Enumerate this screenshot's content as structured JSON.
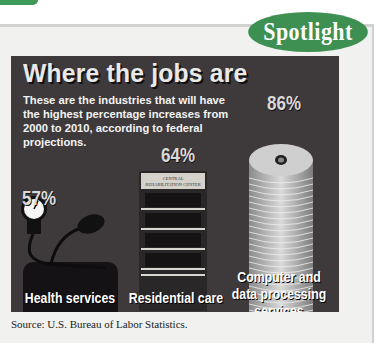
{
  "header": {
    "badge_label": "Spotlight"
  },
  "colors": {
    "accent": "#3d8f52",
    "panel_background": "#3e3a3c",
    "text_light": "#f3f3f3"
  },
  "chart_data": {
    "type": "bar",
    "title": "Where the jobs are",
    "subtitle": "These are the industries that will have the highest percentage increases from 2000 to 2010, according to federal projections.",
    "categories": [
      "Health services",
      "Residential care",
      "Computer and data processing services"
    ],
    "values": [
      57,
      64,
      86
    ],
    "value_labels": [
      "57%",
      "64%",
      "86%"
    ],
    "unit": "%",
    "icons": [
      "blood-pressure-gauge",
      "building",
      "cd-stack"
    ],
    "building_sign": "CENTRAL REHABILITATION CENTER",
    "xlabel": "",
    "ylabel": "Projected percentage increase",
    "ylim": [
      0,
      100
    ],
    "source": "Source: U.S. Bureau of Labor Statistics."
  }
}
